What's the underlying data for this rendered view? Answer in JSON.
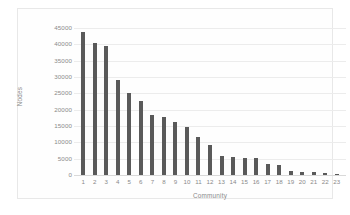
{
  "chart_data": {
    "type": "bar",
    "title": "",
    "xlabel": "Community",
    "ylabel": "Nodes",
    "categories": [
      "1",
      "2",
      "3",
      "4",
      "5",
      "6",
      "7",
      "8",
      "9",
      "10",
      "11",
      "12",
      "13",
      "14",
      "15",
      "16",
      "17",
      "18",
      "19",
      "20",
      "21",
      "22",
      "23"
    ],
    "values": [
      43800,
      40500,
      39500,
      29000,
      25000,
      22800,
      18400,
      17700,
      16200,
      14800,
      11500,
      9300,
      5900,
      5400,
      5100,
      5100,
      3300,
      3000,
      1200,
      900,
      900,
      700,
      200
    ],
    "ylim": [
      0,
      45000
    ],
    "yticks": [
      0,
      5000,
      10000,
      15000,
      20000,
      25000,
      30000,
      35000,
      40000,
      45000
    ],
    "ytick_labels": [
      "0",
      "5000",
      "10000",
      "15000",
      "20000",
      "25000",
      "30000",
      "35000",
      "40000",
      "45000"
    ],
    "grid": true,
    "legend": false,
    "series_color": "#5a5a5a",
    "gridline_color": "#ececec",
    "axis_text_color": "#8a8a8a",
    "plot_background": "#fefefe",
    "frame_border_color": "#e8e8e8"
  }
}
